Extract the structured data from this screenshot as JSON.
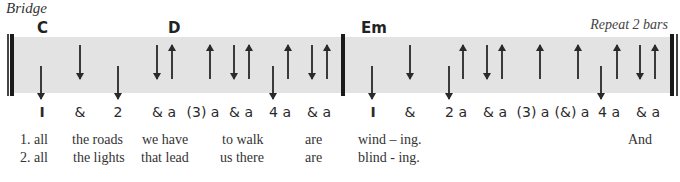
{
  "section_label": "Bridge",
  "repeat_note": "Repeat 2 bars",
  "chords": [
    {
      "name": "C",
      "x": 37
    },
    {
      "name": "D",
      "x": 168
    },
    {
      "name": "Em",
      "x": 361
    }
  ],
  "bars": [
    {
      "arrows": [
        {
          "x": 41,
          "dir": "down",
          "len": "long"
        },
        {
          "x": 80,
          "dir": "down",
          "len": "short"
        },
        {
          "x": 118,
          "dir": "down",
          "len": "long"
        },
        {
          "x": 157,
          "dir": "down",
          "len": "short"
        },
        {
          "x": 172,
          "dir": "up",
          "len": "short"
        },
        {
          "x": 210,
          "dir": "up",
          "len": "short"
        },
        {
          "x": 234,
          "dir": "down",
          "len": "short"
        },
        {
          "x": 249,
          "dir": "up",
          "len": "short"
        },
        {
          "x": 273,
          "dir": "down",
          "len": "long"
        },
        {
          "x": 288,
          "dir": "up",
          "len": "short"
        },
        {
          "x": 312,
          "dir": "down",
          "len": "short"
        },
        {
          "x": 327,
          "dir": "up",
          "len": "short"
        }
      ],
      "counts": [
        {
          "label": "1",
          "x": 42,
          "bold": true
        },
        {
          "label": "&",
          "x": 80
        },
        {
          "label": "2",
          "x": 118
        },
        {
          "label": "& a",
          "x": 164
        },
        {
          "label": "(3) a",
          "x": 203
        },
        {
          "label": "& a",
          "x": 241
        },
        {
          "label": "4 a",
          "x": 280
        },
        {
          "label": "& a",
          "x": 319
        }
      ]
    },
    {
      "arrows": [
        {
          "x": 372,
          "dir": "down",
          "len": "long"
        },
        {
          "x": 410,
          "dir": "down",
          "len": "short"
        },
        {
          "x": 449,
          "dir": "down",
          "len": "long"
        },
        {
          "x": 463,
          "dir": "up",
          "len": "short"
        },
        {
          "x": 487,
          "dir": "down",
          "len": "short"
        },
        {
          "x": 502,
          "dir": "up",
          "len": "short"
        },
        {
          "x": 540,
          "dir": "up",
          "len": "short"
        },
        {
          "x": 578,
          "dir": "up",
          "len": "short"
        },
        {
          "x": 601,
          "dir": "down",
          "len": "long"
        },
        {
          "x": 617,
          "dir": "up",
          "len": "short"
        },
        {
          "x": 640,
          "dir": "down",
          "len": "short"
        },
        {
          "x": 655,
          "dir": "up",
          "len": "short"
        }
      ],
      "counts": [
        {
          "label": "1",
          "x": 373,
          "bold": true
        },
        {
          "label": "&",
          "x": 410
        },
        {
          "label": "2 a",
          "x": 456
        },
        {
          "label": "& a",
          "x": 495
        },
        {
          "label": "(3) a",
          "x": 533
        },
        {
          "label": "(&) a",
          "x": 572
        },
        {
          "label": "4 a",
          "x": 609
        },
        {
          "label": "& a",
          "x": 648
        }
      ]
    }
  ],
  "lyrics": [
    {
      "verse": "1.",
      "words": [
        {
          "text": "1. all",
          "x": 20
        },
        {
          "text": "the roads",
          "x": 72
        },
        {
          "text": "we have",
          "x": 142
        },
        {
          "text": "to walk",
          "x": 222
        },
        {
          "text": "are",
          "x": 305
        },
        {
          "text": "wind – ing.",
          "x": 358
        },
        {
          "text": "And",
          "x": 628
        }
      ]
    },
    {
      "verse": "2.",
      "words": [
        {
          "text": "2. all",
          "x": 20
        },
        {
          "text": "the lights",
          "x": 73
        },
        {
          "text": "that lead",
          "x": 141
        },
        {
          "text": "us there",
          "x": 220
        },
        {
          "text": "are",
          "x": 305
        },
        {
          "text": "blind - ing.",
          "x": 358
        }
      ]
    }
  ]
}
